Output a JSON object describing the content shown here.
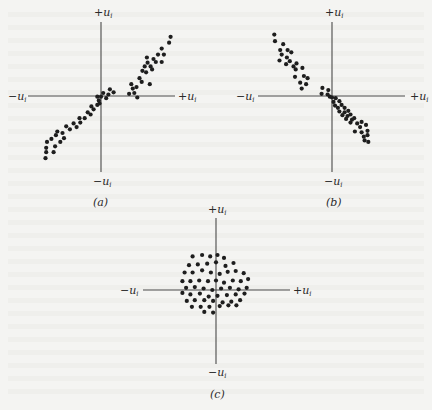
{
  "figure": {
    "axis_label_symbol": "u",
    "axis_label_subscript": "i",
    "axis_label_plus": "+u",
    "axis_label_minus": "−u"
  },
  "chart_data": [
    {
      "type": "scatter",
      "caption": "(a)",
      "title": "",
      "xlabel_pos": "+u_i",
      "xlabel_neg": "−u_i",
      "ylabel_pos": "+u_i",
      "ylabel_neg": "−u_i",
      "xlim": [
        -1,
        1
      ],
      "ylim": [
        -1,
        1
      ],
      "grid": false,
      "points": [
        [
          0.94,
          0.8
        ],
        [
          0.92,
          0.72
        ],
        [
          0.82,
          0.64
        ],
        [
          0.77,
          0.56
        ],
        [
          0.85,
          0.56
        ],
        [
          0.71,
          0.5
        ],
        [
          0.62,
          0.52
        ],
        [
          0.74,
          0.46
        ],
        [
          0.82,
          0.46
        ],
        [
          0.63,
          0.45
        ],
        [
          0.67,
          0.4
        ],
        [
          0.59,
          0.4
        ],
        [
          0.69,
          0.36
        ],
        [
          0.61,
          0.32
        ],
        [
          0.56,
          0.34
        ],
        [
          0.52,
          0.24
        ],
        [
          0.55,
          0.19
        ],
        [
          0.66,
          0.16
        ],
        [
          0.41,
          0.16
        ],
        [
          0.48,
          0.12
        ],
        [
          0.43,
          0.1
        ],
        [
          0.45,
          0.04
        ],
        [
          0.38,
          0.03
        ],
        [
          0.49,
          -0.02
        ],
        [
          0.17,
          0.05
        ],
        [
          0.12,
          0.09
        ],
        [
          0.1,
          0.02
        ],
        [
          0.03,
          0.04
        ],
        [
          0.0,
          -0.01
        ],
        [
          -0.05,
          -0.01
        ],
        [
          -0.03,
          -0.06
        ],
        [
          0.07,
          -0.03
        ],
        [
          -0.02,
          -0.1
        ],
        [
          -0.05,
          -0.12
        ],
        [
          -0.13,
          -0.14
        ],
        [
          -0.1,
          -0.18
        ],
        [
          -0.18,
          -0.22
        ],
        [
          -0.14,
          -0.25
        ],
        [
          -0.22,
          -0.3
        ],
        [
          -0.29,
          -0.3
        ],
        [
          -0.28,
          -0.36
        ],
        [
          -0.37,
          -0.37
        ],
        [
          -0.33,
          -0.42
        ],
        [
          -0.42,
          -0.45
        ],
        [
          -0.47,
          -0.41
        ],
        [
          -0.52,
          -0.5
        ],
        [
          -0.59,
          -0.48
        ],
        [
          -0.61,
          -0.53
        ],
        [
          -0.5,
          -0.57
        ],
        [
          -0.67,
          -0.58
        ],
        [
          -0.55,
          -0.62
        ],
        [
          -0.73,
          -0.62
        ],
        [
          -0.74,
          -0.7
        ],
        [
          -0.62,
          -0.68
        ],
        [
          -0.74,
          -0.76
        ],
        [
          -0.64,
          -0.76
        ],
        [
          -0.75,
          -0.84
        ]
      ]
    },
    {
      "type": "scatter",
      "caption": "(b)",
      "title": "",
      "xlabel_pos": "+u_i",
      "xlabel_neg": "−u_i",
      "ylabel_pos": "+u_i",
      "ylabel_neg": "−u_i",
      "xlim": [
        -1,
        1
      ],
      "ylim": [
        -1,
        1
      ],
      "grid": false,
      "points": [
        [
          -0.78,
          0.83
        ],
        [
          -0.77,
          0.74
        ],
        [
          -0.66,
          0.7
        ],
        [
          -0.7,
          0.62
        ],
        [
          -0.68,
          0.56
        ],
        [
          -0.6,
          0.62
        ],
        [
          -0.55,
          0.59
        ],
        [
          -0.71,
          0.48
        ],
        [
          -0.61,
          0.52
        ],
        [
          -0.57,
          0.47
        ],
        [
          -0.48,
          0.44
        ],
        [
          -0.52,
          0.4
        ],
        [
          -0.62,
          0.43
        ],
        [
          -0.49,
          0.36
        ],
        [
          -0.4,
          0.38
        ],
        [
          -0.5,
          0.26
        ],
        [
          -0.38,
          0.27
        ],
        [
          -0.33,
          0.24
        ],
        [
          -0.43,
          0.18
        ],
        [
          -0.35,
          0.16
        ],
        [
          -0.41,
          0.1
        ],
        [
          -0.13,
          0.11
        ],
        [
          -0.05,
          0.08
        ],
        [
          -0.14,
          0.03
        ],
        [
          -0.06,
          0.02
        ],
        [
          -0.03,
          -0.01
        ],
        [
          0.0,
          -0.02
        ],
        [
          0.05,
          -0.03
        ],
        [
          0.02,
          -0.08
        ],
        [
          0.1,
          -0.07
        ],
        [
          0.04,
          -0.13
        ],
        [
          0.13,
          -0.12
        ],
        [
          0.08,
          -0.16
        ],
        [
          0.17,
          -0.16
        ],
        [
          0.1,
          -0.21
        ],
        [
          0.17,
          -0.22
        ],
        [
          0.22,
          -0.2
        ],
        [
          0.14,
          -0.26
        ],
        [
          0.21,
          -0.27
        ],
        [
          0.25,
          -0.25
        ],
        [
          0.19,
          -0.31
        ],
        [
          0.27,
          -0.32
        ],
        [
          0.3,
          -0.3
        ],
        [
          0.25,
          -0.36
        ],
        [
          0.34,
          -0.37
        ],
        [
          0.4,
          -0.35
        ],
        [
          0.38,
          -0.42
        ],
        [
          0.46,
          -0.39
        ],
        [
          0.31,
          -0.48
        ],
        [
          0.4,
          -0.49
        ],
        [
          0.48,
          -0.47
        ],
        [
          0.43,
          -0.55
        ],
        [
          0.48,
          -0.53
        ],
        [
          0.49,
          -0.62
        ],
        [
          0.44,
          -0.6
        ]
      ]
    },
    {
      "type": "scatter",
      "caption": "(c)",
      "title": "",
      "xlabel_pos": "+u_i",
      "xlabel_neg": "−u_i",
      "ylabel_pos": "+u_i",
      "ylabel_neg": "−u_i",
      "xlim": [
        -1,
        1
      ],
      "ylim": [
        -1,
        1
      ],
      "grid": false,
      "points": [
        [
          -0.32,
          0.46
        ],
        [
          -0.19,
          0.48
        ],
        [
          -0.08,
          0.46
        ],
        [
          0.02,
          0.48
        ],
        [
          0.11,
          0.44
        ],
        [
          -0.37,
          0.34
        ],
        [
          -0.25,
          0.35
        ],
        [
          -0.12,
          0.36
        ],
        [
          0.0,
          0.38
        ],
        [
          0.13,
          0.33
        ],
        [
          0.24,
          0.37
        ],
        [
          -0.43,
          0.24
        ],
        [
          -0.32,
          0.24
        ],
        [
          -0.19,
          0.27
        ],
        [
          -0.07,
          0.24
        ],
        [
          0.05,
          0.22
        ],
        [
          0.16,
          0.25
        ],
        [
          0.27,
          0.26
        ],
        [
          0.38,
          0.23
        ],
        [
          -0.46,
          0.12
        ],
        [
          -0.35,
          0.12
        ],
        [
          -0.23,
          0.13
        ],
        [
          -0.11,
          0.12
        ],
        [
          0.0,
          0.13
        ],
        [
          0.11,
          0.1
        ],
        [
          0.23,
          0.13
        ],
        [
          0.34,
          0.12
        ],
        [
          0.44,
          0.15
        ],
        [
          -0.41,
          0.03
        ],
        [
          -0.29,
          0.04
        ],
        [
          -0.17,
          0.02
        ],
        [
          -0.05,
          0.0
        ],
        [
          0.07,
          0.02
        ],
        [
          0.19,
          0.03
        ],
        [
          0.31,
          0.01
        ],
        [
          0.42,
          0.03
        ],
        [
          -0.46,
          -0.04
        ],
        [
          -0.35,
          -0.06
        ],
        [
          -0.22,
          -0.05
        ],
        [
          -0.1,
          -0.09
        ],
        [
          0.02,
          -0.08
        ],
        [
          0.15,
          -0.07
        ],
        [
          0.27,
          -0.06
        ],
        [
          0.39,
          -0.05
        ],
        [
          -0.4,
          -0.15
        ],
        [
          -0.29,
          -0.14
        ],
        [
          -0.16,
          -0.14
        ],
        [
          -0.04,
          -0.15
        ],
        [
          0.09,
          -0.17
        ],
        [
          0.21,
          -0.16
        ],
        [
          0.33,
          -0.14
        ],
        [
          -0.33,
          -0.23
        ],
        [
          -0.21,
          -0.23
        ],
        [
          -0.09,
          -0.23
        ],
        [
          0.05,
          -0.22
        ],
        [
          0.17,
          -0.21
        ],
        [
          0.28,
          -0.21
        ],
        [
          -0.16,
          -0.3
        ],
        [
          -0.04,
          -0.31
        ]
      ]
    }
  ]
}
